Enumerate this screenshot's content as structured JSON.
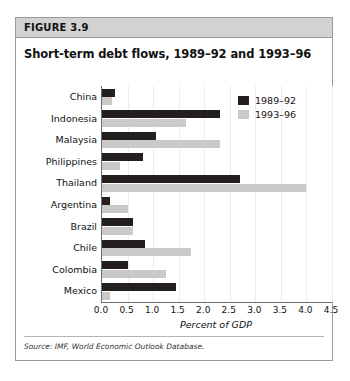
{
  "figure": {
    "header_label": "FIGURE 3.9",
    "title": "Short-term debt flows, 1989–92 and 1993–96",
    "source": "Source: IMF, World Economic Outlook Database."
  },
  "colors": {
    "series_1989_92": "#231f20",
    "series_1993_96": "#c9c9c9",
    "header_background": "#d2d2d2",
    "frame_border": "#9a9a9a",
    "axis": "#6f6f6f"
  },
  "chart_data": {
    "type": "bar",
    "orientation": "horizontal",
    "title": "Short-term debt flows, 1989–92 and 1993–96",
    "subtitle": "",
    "xlabel": "Percent of GDP",
    "ylabel": "",
    "xlim": [
      0.0,
      4.5
    ],
    "xticks": [
      "0.0",
      "0.5",
      "1.0",
      "1.5",
      "2.0",
      "2.5",
      "3.0",
      "3.5",
      "4.0",
      "4.5"
    ],
    "xtick_values": [
      0.0,
      0.5,
      1.0,
      1.5,
      2.0,
      2.5,
      3.0,
      3.5,
      4.0,
      4.5
    ],
    "grid": false,
    "legend_position": "top-right",
    "categories": [
      "China",
      "Indonesia",
      "Malaysia",
      "Philippines",
      "Thailand",
      "Argentina",
      "Brazil",
      "Chile",
      "Colombia",
      "Mexico"
    ],
    "series": [
      {
        "name": "1989–92",
        "color": "#231f20",
        "values": [
          0.25,
          2.3,
          1.05,
          0.8,
          2.7,
          0.15,
          0.6,
          0.85,
          0.5,
          1.45
        ]
      },
      {
        "name": "1993–96",
        "color": "#c9c9c9",
        "values": [
          0.2,
          1.65,
          2.3,
          0.35,
          4.0,
          0.5,
          0.6,
          1.75,
          1.25,
          0.15
        ]
      }
    ]
  }
}
